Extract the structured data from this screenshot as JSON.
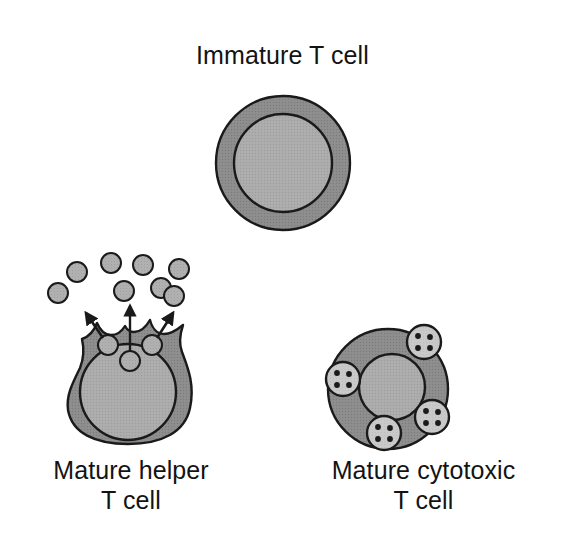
{
  "figure": {
    "background_color": "#ffffff",
    "title": "Immature T cell",
    "labels": {
      "helper": "Mature helper\nT cell",
      "cytotoxic": "Mature cytotoxic\nT cell"
    }
  },
  "palette": {
    "cytoplasm": "#8c8c8c",
    "nucleus": "#ababab",
    "vesicle": "#b0b0b0",
    "granule_fill": "#c9c9c9",
    "outline": "#1a1a1a",
    "text": "#131313",
    "particle": "#a8a8a8"
  },
  "cells": [
    {
      "id": "immature-t-cell",
      "name": "Immature T cell",
      "shape": "circle",
      "center": [
        283,
        163
      ],
      "radius": 67,
      "nucleus": {
        "center": [
          283,
          163
        ],
        "radius": 49
      },
      "features": []
    },
    {
      "id": "mature-helper-t-cell",
      "name": "Mature helper T cell",
      "shape": "lobed-blob",
      "center": [
        128,
        385
      ],
      "nucleus": {
        "center": [
          128,
          392
        ],
        "radius": 48
      },
      "vesicles": [
        {
          "center": [
            108,
            345
          ],
          "radius": 10
        },
        {
          "center": [
            152,
            345
          ],
          "radius": 10
        },
        {
          "center": [
            130,
            361
          ],
          "radius": 10
        }
      ],
      "arrows": [
        {
          "from": [
            112,
            340
          ],
          "to": [
            84,
            310
          ],
          "style": "short-diagonal-left"
        },
        {
          "from": [
            130,
            358
          ],
          "to": [
            130,
            305
          ],
          "style": "long-vertical"
        },
        {
          "from": [
            148,
            340
          ],
          "to": [
            174,
            310
          ],
          "style": "short-diagonal-right"
        }
      ],
      "secreted_particles": [
        {
          "center": [
            77,
            272
          ],
          "radius": 10
        },
        {
          "center": [
            58,
            293
          ],
          "radius": 10
        },
        {
          "center": [
            111,
            263
          ],
          "radius": 10
        },
        {
          "center": [
            143,
            265
          ],
          "radius": 10
        },
        {
          "center": [
            124,
            291
          ],
          "radius": 10
        },
        {
          "center": [
            161,
            288
          ],
          "radius": 10
        },
        {
          "center": [
            179,
            269
          ],
          "radius": 10
        },
        {
          "center": [
            174,
            296
          ],
          "radius": 10
        }
      ]
    },
    {
      "id": "mature-cytotoxic-t-cell",
      "name": "Mature cytotoxic T cell",
      "shape": "circle",
      "center": [
        388,
        389
      ],
      "radius": 60,
      "nucleus": {
        "center": [
          392,
          387
        ],
        "radius": 33
      },
      "granules": [
        {
          "center": [
            424,
            342
          ],
          "radius": 17,
          "dots": 4
        },
        {
          "center": [
            343,
            379
          ],
          "radius": 17,
          "dots": 4
        },
        {
          "center": [
            432,
            417
          ],
          "radius": 17,
          "dots": 4
        },
        {
          "center": [
            384,
            433
          ],
          "radius": 17,
          "dots": 4
        }
      ]
    }
  ]
}
